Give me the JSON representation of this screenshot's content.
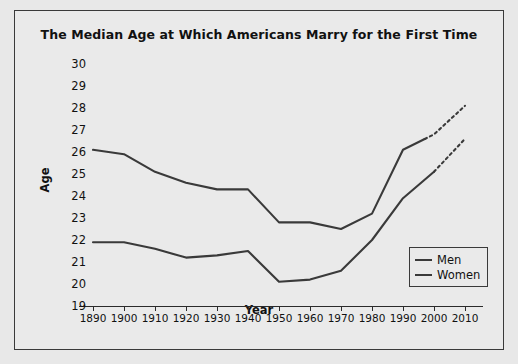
{
  "chart_data": {
    "type": "line",
    "title": "The Median Age at Which Americans Marry for the First Time",
    "xlabel": "Year",
    "ylabel": "Age",
    "xlim": [
      1890,
      2010
    ],
    "ylim": [
      19,
      30
    ],
    "grid": false,
    "legend_position": "bottom-right",
    "x_ticks": [
      1890,
      1900,
      1910,
      1920,
      1930,
      1940,
      1950,
      1960,
      1970,
      1980,
      1990,
      2000,
      2010
    ],
    "y_ticks": [
      19,
      20,
      21,
      22,
      23,
      24,
      25,
      26,
      27,
      28,
      29,
      30
    ],
    "categories": [
      1890,
      1900,
      1910,
      1920,
      1930,
      1940,
      1950,
      1960,
      1970,
      1980,
      1990,
      2000,
      2010
    ],
    "series": [
      {
        "name": "Men",
        "color": "#3a3a3a",
        "values": [
          26.1,
          25.9,
          25.1,
          24.6,
          24.3,
          24.3,
          22.8,
          22.8,
          22.5,
          23.2,
          26.1,
          26.8,
          28.1
        ],
        "solid_through": 1997,
        "projected_from": 1997,
        "projected_style": "dashed"
      },
      {
        "name": "Women",
        "color": "#3a3a3a",
        "values": [
          21.9,
          21.9,
          21.6,
          21.2,
          21.3,
          21.5,
          20.1,
          20.2,
          20.6,
          22.0,
          23.9,
          25.1,
          26.6
        ],
        "solid_through": 2000,
        "projected_from": 2000,
        "projected_style": "dashed"
      }
    ]
  },
  "legend": {
    "items": [
      {
        "label": "Men"
      },
      {
        "label": "Women"
      }
    ]
  }
}
